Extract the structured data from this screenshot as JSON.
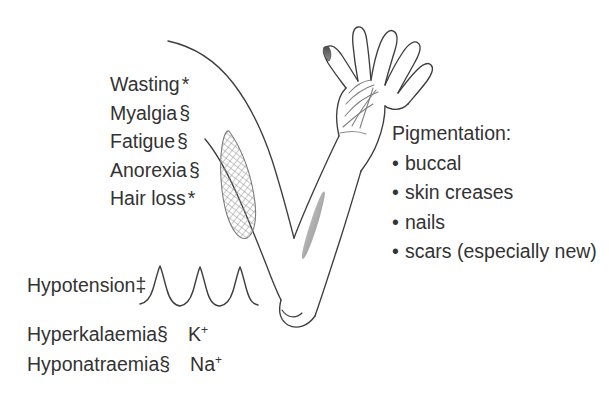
{
  "figure": {
    "background_color": "#ffffff",
    "ink_color": "#333333"
  },
  "symptom_list": {
    "items": [
      {
        "label": "Wasting",
        "mark": "*"
      },
      {
        "label": "Myalgia",
        "mark": "§"
      },
      {
        "label": "Fatigue",
        "mark": "§"
      },
      {
        "label": "Anorexia",
        "mark": "§"
      },
      {
        "label": "Hair loss",
        "mark": "*"
      }
    ]
  },
  "pigmentation": {
    "heading": "Pigmentation:",
    "bullet_glyph": "•",
    "items": [
      "buccal",
      "skin creases",
      "nails",
      "scars (especially new)"
    ]
  },
  "signs": {
    "hypotension": {
      "label": "Hypotension",
      "mark": "‡"
    },
    "hyperkalaemia": {
      "label": "Hyperkalaemia",
      "mark": "§",
      "ion": "K",
      "charge": "+"
    },
    "hyponatraemia": {
      "label": "Hyponatraemia",
      "mark": "§",
      "ion": "Na",
      "charge": "+"
    }
  },
  "illustration": {
    "name": "raised-arm-line-drawing",
    "parts": [
      "shoulder",
      "upper-arm",
      "wasted-muscle",
      "forearm",
      "elbow",
      "open-hand",
      "palm-creases",
      "pigmented-thumbnail",
      "pigmented-scar"
    ]
  },
  "waveform": {
    "name": "blood-pressure-trace",
    "peaks": 3
  }
}
